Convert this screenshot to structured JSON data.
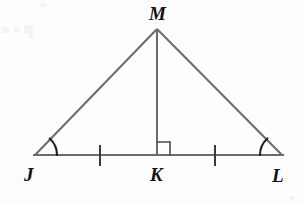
{
  "figure": {
    "width": 304,
    "height": 205,
    "background_color": "#fdfdfd",
    "line_color": "#6b6b6b",
    "mark_color": "#1c1c1c",
    "label_color": "#121212"
  },
  "labels": {
    "apex": "M",
    "left_base": "J",
    "foot": "K",
    "right_base": "L"
  },
  "points": {
    "J": {
      "x": 35,
      "y": 155
    },
    "K": {
      "x": 157,
      "y": 155
    },
    "L": {
      "x": 282,
      "y": 155
    },
    "M": {
      "x": 157,
      "y": 29
    }
  },
  "label_positions": {
    "M": {
      "x": 149,
      "y": 4
    },
    "J": {
      "x": 24,
      "y": 165
    },
    "K": {
      "x": 150,
      "y": 165
    },
    "L": {
      "x": 272,
      "y": 166
    }
  },
  "segments": [
    {
      "name": "JM",
      "from": "J",
      "to": "M"
    },
    {
      "name": "ML",
      "from": "M",
      "to": "L"
    },
    {
      "name": "JL",
      "from": "J",
      "to": "L"
    },
    {
      "name": "MK",
      "from": "M",
      "to": "K"
    }
  ],
  "marks": {
    "right_angle": {
      "at": "K",
      "size": 13,
      "opens": "right",
      "path": "M 157 142 L 170 142 L 170 155"
    },
    "tick_marks": [
      {
        "name": "tick-JK",
        "x": 100,
        "y_top": 145,
        "y_bottom": 165
      },
      {
        "name": "tick-KL",
        "x": 215,
        "y_top": 145,
        "y_bottom": 165
      }
    ],
    "angle_arcs": [
      {
        "name": "angle-J",
        "vertex": "J",
        "radius": 22,
        "path": "M 57 155 A 22 22 0 0 0 49.7 138.5"
      },
      {
        "name": "angle-L",
        "vertex": "L",
        "radius": 22,
        "path": "M 260 155 A 22 22 0 0 1 267.4 138.4"
      }
    ]
  },
  "specks": [
    {
      "x": 2,
      "y": 27,
      "w": 7,
      "h": 6
    },
    {
      "x": 13,
      "y": 27,
      "w": 7,
      "h": 6
    },
    {
      "x": 24,
      "y": 25,
      "w": 9,
      "h": 9
    },
    {
      "x": 29,
      "y": 32,
      "w": 4,
      "h": 7
    },
    {
      "x": 40,
      "y": 3,
      "w": 6,
      "h": 4
    },
    {
      "x": 289,
      "y": 196,
      "w": 5,
      "h": 4
    }
  ]
}
